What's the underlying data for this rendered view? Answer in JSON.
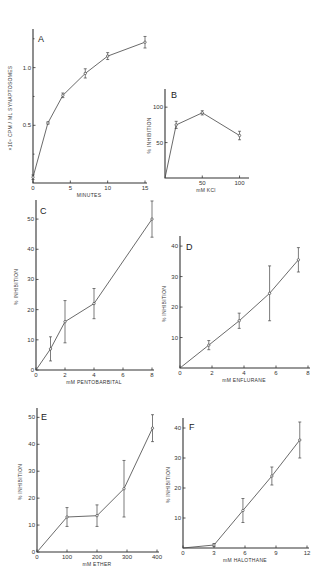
{
  "figure": {
    "panels": [
      "A",
      "B",
      "C",
      "D",
      "E",
      "F"
    ]
  },
  "chart_data": [
    {
      "panel": "A",
      "type": "line",
      "title": "",
      "xlabel": "MINUTES",
      "ylabel": "×10⁶ CPM / ML SYNAPTOSOMES",
      "x_ticks": [
        "0",
        "5",
        "10",
        "15"
      ],
      "y_ticks": [
        "0.5",
        "1.0"
      ],
      "xlim": [
        0,
        15
      ],
      "ylim": [
        0,
        1.3
      ],
      "x": [
        0,
        2,
        4,
        7,
        10,
        15
      ],
      "values": [
        0.05,
        0.52,
        0.76,
        0.95,
        1.1,
        1.22
      ],
      "errors": [
        0.02,
        0.01,
        0.02,
        0.04,
        0.03,
        0.05
      ],
      "grid": false
    },
    {
      "panel": "B",
      "type": "line",
      "title": "",
      "xlabel": "mM KCl",
      "ylabel": "% INHIBITION",
      "x_ticks": [
        "50",
        "100"
      ],
      "y_ticks": [
        "50",
        "100"
      ],
      "xlim": [
        0,
        110
      ],
      "ylim": [
        0,
        120
      ],
      "x": [
        0,
        15,
        50,
        100
      ],
      "values": [
        0,
        75,
        92,
        60
      ],
      "errors": [
        0,
        5,
        3,
        6
      ],
      "grid": false
    },
    {
      "panel": "C",
      "type": "line",
      "title": "",
      "xlabel": "mM PENTOBARBITAL",
      "ylabel": "% INHIBITION",
      "x_ticks": [
        "0",
        "2",
        "4",
        "6",
        "8"
      ],
      "y_ticks": [
        "0",
        "10",
        "20",
        "30",
        "40",
        "50"
      ],
      "xlim": [
        0,
        8
      ],
      "ylim": [
        0,
        55
      ],
      "x": [
        0,
        1,
        2,
        4,
        8
      ],
      "values": [
        0,
        7,
        16,
        22,
        50
      ],
      "errors": [
        0,
        4,
        7,
        5,
        6
      ],
      "grid": false
    },
    {
      "panel": "D",
      "type": "line",
      "title": "",
      "xlabel": "mM ENFLURANE",
      "ylabel": "% INHIBITION",
      "x_ticks": [
        "0",
        "2",
        "4",
        "6",
        "8"
      ],
      "y_ticks": [
        "10",
        "20",
        "30",
        "40"
      ],
      "xlim": [
        0,
        8
      ],
      "ylim": [
        0,
        42
      ],
      "x": [
        0,
        1.8,
        3.7,
        5.6,
        7.4
      ],
      "values": [
        0,
        7.5,
        15.5,
        24.5,
        35.5
      ],
      "errors": [
        0,
        1.5,
        2.5,
        9,
        4
      ],
      "grid": false
    },
    {
      "panel": "E",
      "type": "line",
      "title": "",
      "xlabel": "mM ETHER",
      "ylabel": "% INHIBITION",
      "x_ticks": [
        "0",
        "100",
        "200",
        "300",
        "400"
      ],
      "y_ticks": [
        "0",
        "10",
        "20",
        "30",
        "40",
        "50"
      ],
      "xlim": [
        0,
        400
      ],
      "ylim": [
        0,
        52
      ],
      "x": [
        0,
        100,
        200,
        290,
        385
      ],
      "values": [
        0,
        13,
        13.5,
        23.5,
        46
      ],
      "errors": [
        0,
        3.5,
        4,
        10.5,
        5
      ],
      "grid": false
    },
    {
      "panel": "F",
      "type": "line",
      "title": "",
      "xlabel": "mM HALOTHANE",
      "ylabel": "% INHIBITION",
      "x_ticks": [
        "0",
        "3",
        "6",
        "9",
        "12"
      ],
      "y_ticks": [
        "10",
        "20",
        "30",
        "40"
      ],
      "xlim": [
        0,
        12
      ],
      "ylim": [
        0,
        42
      ],
      "x": [
        0,
        3,
        5.8,
        8.6,
        11.3
      ],
      "values": [
        0,
        1,
        12.5,
        24,
        36
      ],
      "errors": [
        0,
        0.5,
        4,
        3,
        6
      ],
      "grid": false
    }
  ]
}
